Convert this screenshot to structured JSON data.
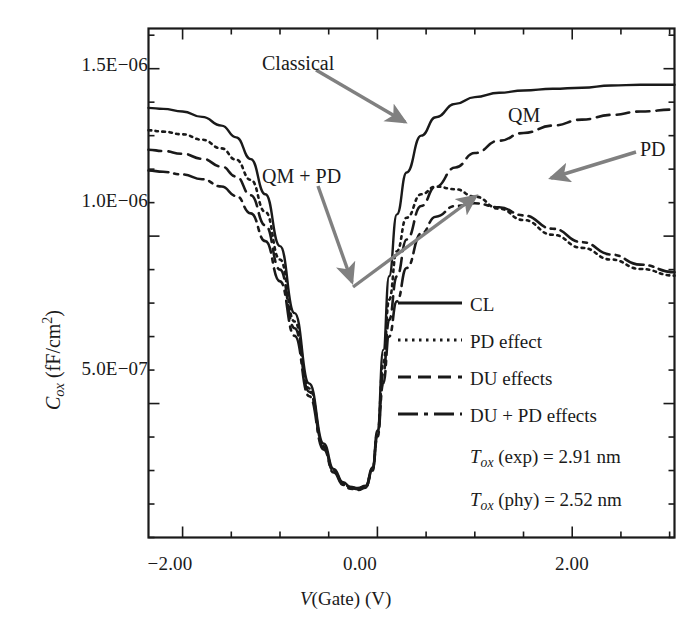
{
  "figure": {
    "background": "#ffffff",
    "ink": "#1a1a1a",
    "arrow_color": "#7a7a7a"
  },
  "axes": {
    "x_title_v": "V",
    "x_title_rest": "(Gate) (V)",
    "y_title_c": "C",
    "y_title_sub": "ox",
    "y_title_rest": " (fF/cm",
    "y_title_sup": "2",
    "y_title_close": ")",
    "x_ticks": [
      "−2.00",
      "0.00",
      "2.00"
    ],
    "y_ticks": [
      "1.5E−06",
      "1.0E−06",
      "5.0E−07"
    ]
  },
  "annotations": {
    "classical": "Classical",
    "qm": "QM",
    "pd": "PD",
    "qm_pd": "QM + PD"
  },
  "legend": {
    "items": [
      {
        "label": "CL",
        "style": "solid"
      },
      {
        "label": "PD effect",
        "style": "dotted"
      },
      {
        "label": "DU effects",
        "style": "dashed"
      },
      {
        "label": "DU + PD effects",
        "style": "dashdot"
      }
    ]
  },
  "parameters": [
    {
      "sym": "T",
      "sub": "ox",
      "text": " (exp) = 2.91 nm"
    },
    {
      "sym": "T",
      "sub": "ox",
      "text": " (phy) = 2.52 nm"
    }
  ],
  "chart_data": {
    "type": "line",
    "title": "",
    "xlabel": "V(Gate) (V)",
    "ylabel": "Cox (fF/cm^2)",
    "xlim": [
      -2.35,
      3.05
    ],
    "ylim": [
      1e-07,
      1.62e-06
    ],
    "grid": false,
    "legend_position": "inside-lower-right",
    "x_ticks_major": [
      -2.0,
      0.0,
      2.0
    ],
    "x_ticks_minor_step": 0.5,
    "y_ticks_major": [
      1.5e-06,
      1e-06,
      5e-07
    ],
    "annotations": [
      {
        "text": "Classical",
        "points_to_series": "CL"
      },
      {
        "text": "QM",
        "points_to_series": "DU effects"
      },
      {
        "text": "PD",
        "points_to_series": "PD effect"
      },
      {
        "text": "QM + PD",
        "points_to_series": "DU + PD effects"
      }
    ],
    "parameters": {
      "Tox_exp_nm": 2.91,
      "Tox_phy_nm": 2.52
    },
    "x": [
      -2.35,
      -2.2,
      -2.0,
      -1.8,
      -1.6,
      -1.45,
      -1.3,
      -1.15,
      -1.0,
      -0.85,
      -0.7,
      -0.55,
      -0.45,
      -0.35,
      -0.28,
      -0.2,
      -0.12,
      -0.05,
      0.0,
      0.06,
      0.12,
      0.2,
      0.3,
      0.45,
      0.6,
      0.8,
      1.0,
      1.25,
      1.5,
      1.8,
      2.1,
      2.4,
      2.7,
      3.05
    ],
    "series": [
      {
        "name": "CL",
        "style": "solid",
        "values": [
          1.383e-06,
          1.38e-06,
          1.372e-06,
          1.356e-06,
          1.33e-06,
          1.295e-06,
          1.23e-06,
          1.125e-06,
          9.7e-07,
          7.7e-07,
          5.6e-07,
          3.8e-07,
          3.05e-07,
          2.65e-07,
          2.52e-07,
          2.48e-07,
          2.55e-07,
          3.1e-07,
          4.2e-07,
          6.6e-07,
          8.8e-07,
          1.065e-06,
          1.19e-06,
          1.3e-06,
          1.355e-06,
          1.395e-06,
          1.415e-06,
          1.428e-06,
          1.435e-06,
          1.44e-06,
          1.443e-06,
          1.45e-06,
          1.452e-06,
          1.452e-06
        ]
      },
      {
        "name": "PD effect",
        "style": "dotted",
        "values": [
          1.316e-06,
          1.312e-06,
          1.304e-06,
          1.288e-06,
          1.262e-06,
          1.228e-06,
          1.168e-06,
          1.072e-06,
          9.3e-07,
          7.45e-07,
          5.45e-07,
          3.72e-07,
          3e-07,
          2.62e-07,
          2.5e-07,
          2.46e-07,
          2.53e-07,
          3.05e-07,
          4.1e-07,
          6.2e-07,
          8.1e-07,
          9.55e-07,
          1.055e-06,
          1.125e-06,
          1.148e-06,
          1.14e-06,
          1.118e-06,
          1.082e-06,
          1.048e-06,
          1.004e-06,
          9.65e-07,
          9.3e-07,
          9.02e-07,
          8.82e-07
        ]
      },
      {
        "name": "DU effects",
        "style": "dashed",
        "values": [
          1.258e-06,
          1.254e-06,
          1.246e-06,
          1.231e-06,
          1.208e-06,
          1.178e-06,
          1.122e-06,
          1.032e-06,
          9e-07,
          7.25e-07,
          5.35e-07,
          3.68e-07,
          2.98e-07,
          2.6e-07,
          2.48e-07,
          2.44e-07,
          2.51e-07,
          3.02e-07,
          4.05e-07,
          5.9e-07,
          7.5e-07,
          8.8e-07,
          9.9e-07,
          1.09e-06,
          1.148e-06,
          1.205e-06,
          1.248e-06,
          1.285e-06,
          1.308e-06,
          1.33e-06,
          1.348e-06,
          1.362e-06,
          1.372e-06,
          1.378e-06
        ]
      },
      {
        "name": "DU + PD effects",
        "style": "dashdot",
        "values": [
          1.196e-06,
          1.192e-06,
          1.184e-06,
          1.17e-06,
          1.148e-06,
          1.12e-06,
          1.068e-06,
          9.85e-07,
          8.65e-07,
          7.02e-07,
          5.22e-07,
          3.62e-07,
          2.94e-07,
          2.57e-07,
          2.46e-07,
          2.42e-07,
          2.49e-07,
          3e-07,
          4e-07,
          5.6e-07,
          7e-07,
          8.05e-07,
          9.05e-07,
          1.008e-06,
          1.058e-06,
          1.09e-06,
          1.098e-06,
          1.086e-06,
          1.062e-06,
          1.022e-06,
          9.82e-07,
          9.45e-07,
          9.15e-07,
          8.92e-07
        ]
      }
    ]
  }
}
